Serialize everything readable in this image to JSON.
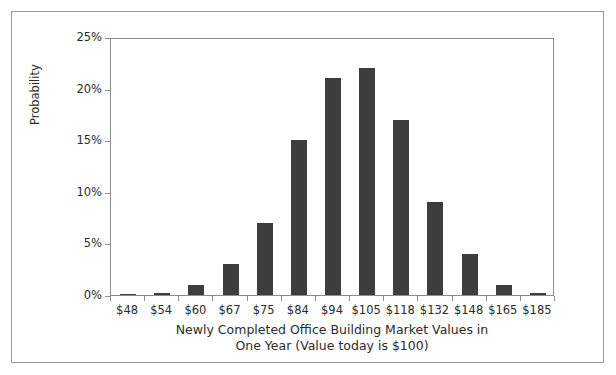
{
  "chart_data": {
    "type": "bar",
    "title": "",
    "xlabel_line1": "Newly Completed Office Building Market Values in",
    "xlabel_line2": "One Year (Value today is $100)",
    "ylabel": "Probability",
    "categories": [
      "$48",
      "$54",
      "$60",
      "$67",
      "$75",
      "$84",
      "$94",
      "$105",
      "$118",
      "$132",
      "$148",
      "$165",
      "$185"
    ],
    "values": [
      0.1,
      0.2,
      1,
      3,
      7,
      15,
      21,
      22,
      17,
      9,
      4,
      1,
      0.2
    ],
    "ytick_labels": [
      "0%",
      "5%",
      "10%",
      "15%",
      "20%",
      "25%"
    ],
    "ytick_values": [
      0,
      5,
      10,
      15,
      20,
      25
    ],
    "ylim": [
      0,
      25
    ],
    "grid": false,
    "legend": "none",
    "value_unit": "%",
    "bar_color": "#3d3d3d",
    "axis_color": "#8c8c8c",
    "text_color": "#2b2b2b",
    "background_color": "#ffffff"
  }
}
